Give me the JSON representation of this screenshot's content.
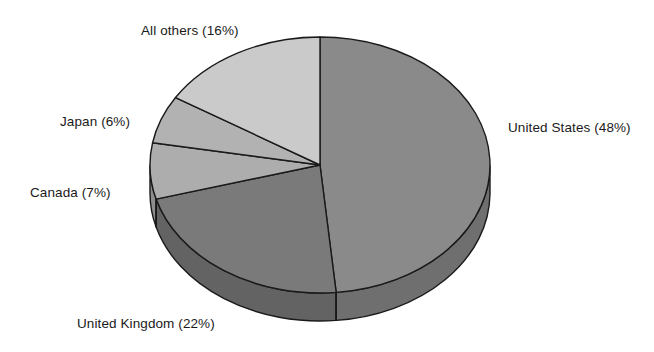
{
  "chart_data": {
    "type": "pie",
    "title": "",
    "subtitle": "",
    "xlabel": "",
    "ylabel": "",
    "legend_position": "none",
    "grid": false,
    "style": "3d-exploded-none",
    "units": "percent",
    "start_angle_deg": 0,
    "direction": "clockwise",
    "categories": [
      "United States",
      "United Kingdom",
      "Canada",
      "Japan",
      "All others"
    ],
    "values": [
      48,
      22,
      7,
      6,
      16
    ],
    "labels": [
      "United States (48%)",
      "United Kingdom (22%)",
      "Canada (7%)",
      "Japan (6%)",
      "All others (16%)"
    ],
    "colors": [
      "#8a8a8a",
      "#7a7a7a",
      "#adadad",
      "#b2b2b2",
      "#cacaca"
    ],
    "slices": [
      {
        "name": "United States",
        "value": 48,
        "label": "United States (48%)",
        "color": "#8a8a8a",
        "side_color": "#6f6f6f"
      },
      {
        "name": "United Kingdom",
        "value": 22,
        "label": "United Kingdom (22%)",
        "color": "#7a7a7a",
        "side_color": "#636363"
      },
      {
        "name": "Canada",
        "value": 7,
        "label": "Canada (7%)",
        "color": "#adadad",
        "side_color": "#8d8d8d"
      },
      {
        "name": "Japan",
        "value": 6,
        "label": "Japan (6%)",
        "color": "#b2b2b2",
        "side_color": "#919191"
      },
      {
        "name": "All others",
        "value": 16,
        "label": "All others (16%)",
        "color": "#cacaca",
        "side_color": "#a6a6a6"
      }
    ],
    "total": 99,
    "outline_color": "#1a1a1a",
    "background_color": "#ffffff"
  },
  "geometry": {
    "center_x": 320,
    "center_y": 165,
    "radius_x": 170,
    "radius_y": 128,
    "depth": 28
  },
  "labels": {
    "all_others": "All others (16%)",
    "united_states": "United States (48%)",
    "japan": "Japan (6%)",
    "canada": "Canada (7%)",
    "united_kingdom": "United Kingdom (22%)"
  }
}
